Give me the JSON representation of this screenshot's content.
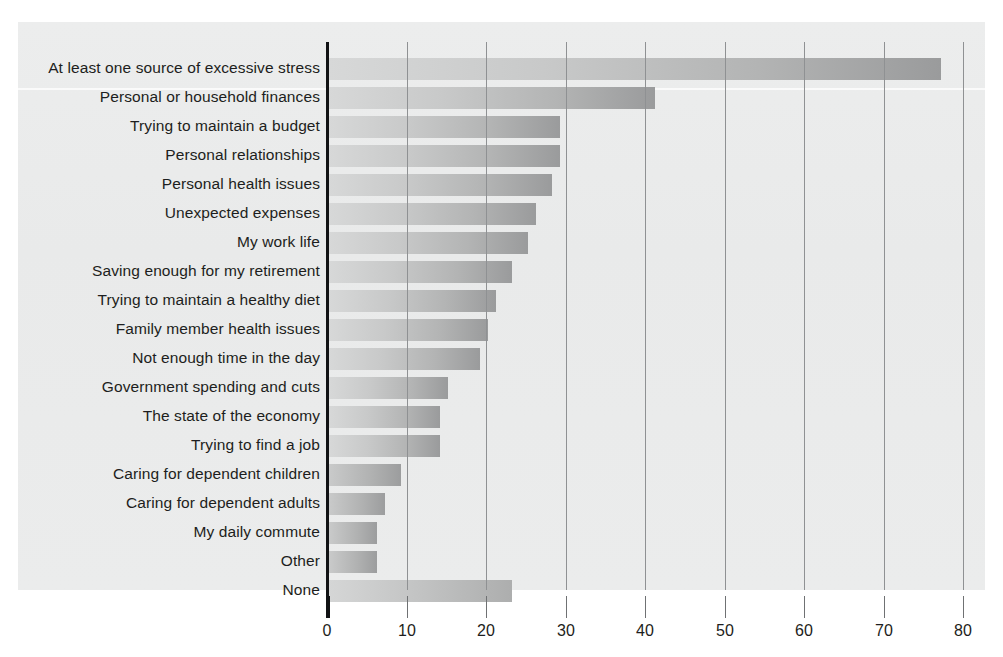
{
  "chart_data": {
    "type": "bar",
    "orientation": "horizontal",
    "title": "",
    "subtitle": "",
    "xlabel": "",
    "ylabel": "",
    "xlim": [
      0,
      80
    ],
    "xticks": [
      0,
      10,
      20,
      30,
      40,
      50,
      60,
      70,
      80
    ],
    "grid": true,
    "legend": false,
    "categories": [
      "At least one source of excessive stress",
      "Personal or household finances",
      "Trying to maintain a budget",
      "Personal relationships",
      "Personal health issues",
      "Unexpected expenses",
      "My work life",
      "Saving enough for my retirement",
      "Trying to maintain a healthy diet",
      "Family member health issues",
      "Not enough time in the day",
      "Government spending and cuts",
      "The state of the economy",
      "Trying to find a job",
      "Caring for dependent children",
      "Caring for dependent adults",
      "My daily commute",
      "Other",
      "None"
    ],
    "values": [
      77,
      41,
      29,
      29,
      28,
      26,
      25,
      23,
      21,
      20,
      19,
      15,
      14,
      14,
      9,
      7,
      6,
      6,
      23
    ],
    "colors": {
      "bar_gradient_start": "#d7d8d8",
      "bar_gradient_end": "#9a9b9c",
      "panel_background": "#eceded",
      "axis": "#111214",
      "gridline": "#8f9193",
      "text": "#1d1e20"
    }
  }
}
